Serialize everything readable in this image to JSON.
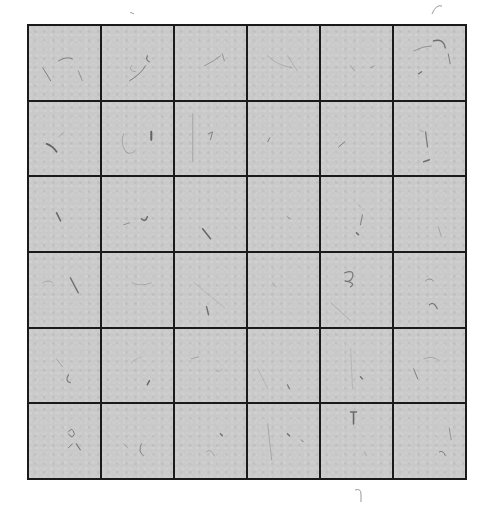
{
  "image": {
    "description": "Scanned 6x6 grid of gray squares with scattered fibers/specks",
    "background_color": "#ffffff",
    "cell_color": "#c9c9c9",
    "line_color": "#1a1a1a",
    "rows": 6,
    "columns": 6
  },
  "specks": [
    [
      {
        "d": "M14 42 L22 55",
        "w": 1
      },
      {
        "d": "M30 35 Q38 30 44 33",
        "w": 1
      },
      {
        "d": "M50 45 L54 55",
        "w": 0.8
      }
    ],
    [
      {
        "d": "M28 55 Q40 48 44 40",
        "w": 1
      },
      {
        "d": "M46 30 Q44 34 48 36",
        "w": 1.2
      },
      {
        "d": "M30 40 Q26 45 34 46",
        "w": 0.6
      }
    ],
    [
      {
        "d": "M30 40 Q40 35 46 30",
        "w": 0.8
      },
      {
        "d": "M48 28 L50 35",
        "w": 0.8
      }
    ],
    [
      {
        "d": "M20 30 Q30 40 45 42",
        "w": 0.5
      },
      {
        "d": "M40 30 L50 45",
        "w": 0.5
      }
    ],
    [
      {
        "d": "M30 40 L34 45",
        "w": 0.7
      },
      {
        "d": "M50 42 L54 40",
        "w": 0.7
      }
    ],
    [
      {
        "d": "M40 15 Q50 12 52 22",
        "w": 1.4
      },
      {
        "d": "M20 25 Q30 20 38 20",
        "w": 0.8
      },
      {
        "d": "M55 28 L57 38",
        "w": 1
      },
      {
        "d": "M25 48 L28 46",
        "w": 1.4
      }
    ],
    [
      {
        "d": "M18 42 Q24 44 28 50",
        "w": 1.8
      },
      {
        "d": "M30 35 L36 30",
        "w": 0.5
      }
    ],
    [
      {
        "d": "M22 32 Q18 40 24 50 Q30 54 34 48",
        "w": 0.6
      },
      {
        "d": "M50 30 L50 38",
        "w": 2
      }
    ],
    [
      {
        "d": "M18 12 L18 60",
        "w": 0.6
      },
      {
        "d": "M34 32 L38 30 L36 38",
        "w": 1
      }
    ],
    [
      {
        "d": "M20 40 L22 36",
        "w": 1
      }
    ],
    [
      {
        "d": "M18 45 L24 40",
        "w": 1
      }
    ],
    [
      {
        "d": "M32 30 L34 45",
        "w": 1.2
      },
      {
        "d": "M30 60 L36 58",
        "w": 1.4
      },
      {
        "d": "M26 28 L30 30",
        "w": 0.6
      }
    ],
    [
      {
        "d": "M28 36 L32 44",
        "w": 1.6
      }
    ],
    [
      {
        "d": "M22 48 L28 46",
        "w": 0.8
      },
      {
        "d": "M40 42 Q44 46 46 40",
        "w": 1.6
      }
    ],
    [
      {
        "d": "M28 52 L36 62",
        "w": 1.6
      }
    ],
    [
      {
        "d": "M40 40 L42 42",
        "w": 1
      }
    ],
    [
      {
        "d": "M38 28 L40 30",
        "w": 0.6
      },
      {
        "d": "M42 38 L40 48",
        "w": 1
      },
      {
        "d": "M36 56 L38 58",
        "w": 1.6
      }
    ],
    [
      {
        "d": "M45 50 L48 60",
        "w": 0.6
      }
    ],
    [
      {
        "d": "M14 30 Q20 26 24 30",
        "w": 0.6
      },
      {
        "d": "M42 25 L50 40",
        "w": 1.4
      }
    ],
    [
      {
        "d": "M30 30 Q40 34 50 30",
        "w": 0.5
      }
    ],
    [
      {
        "d": "M20 30 L50 55",
        "w": 0.4
      },
      {
        "d": "M32 54 L34 62",
        "w": 1.4
      }
    ],
    [
      {
        "d": "M25 30 L28 34",
        "w": 0.6
      }
    ],
    [
      {
        "d": "M24 20 Q34 16 32 24 Q30 30 24 28 Q36 30 30 34",
        "w": 1.2
      },
      {
        "d": "M10 50 L30 68",
        "w": 0.5
      }
    ],
    [
      {
        "d": "M32 28 Q36 24 40 28",
        "w": 0.8
      },
      {
        "d": "M36 52 Q40 48 44 56",
        "w": 1.2
      }
    ],
    [
      {
        "d": "M28 30 L34 38",
        "w": 0.6
      },
      {
        "d": "M40 46 Q36 52 42 54",
        "w": 1.2
      }
    ],
    [
      {
        "d": "M40 28 Q30 32 30 34",
        "w": 0.4
      },
      {
        "d": "M46 56 L48 52",
        "w": 1.6
      }
    ],
    [
      {
        "d": "M16 30 L24 28",
        "w": 0.6
      },
      {
        "d": "M40 40 Q44 46 48 40",
        "w": 0.4
      }
    ],
    [
      {
        "d": "M40 56 L42 60",
        "w": 1.2
      },
      {
        "d": "M10 40 L20 60",
        "w": 0.4
      }
    ],
    [
      {
        "d": "M30 20 L32 60",
        "w": 0.4
      },
      {
        "d": "M40 48 L42 50",
        "w": 1.4
      }
    ],
    [
      {
        "d": "M30 30 Q40 26 46 32",
        "w": 0.6
      },
      {
        "d": "M20 40 L24 50",
        "w": 1
      }
    ],
    [
      {
        "d": "M40 28 Q44 22 46 30 Q44 36 40 30",
        "w": 1
      },
      {
        "d": "M48 40 L52 46",
        "w": 1.2
      },
      {
        "d": "M40 44 L44 40",
        "w": 1
      }
    ],
    [
      {
        "d": "M40 40 Q36 48 42 52",
        "w": 1
      },
      {
        "d": "M22 40 L26 44",
        "w": 0.6
      }
    ],
    [
      {
        "d": "M32 48 Q36 44 40 52",
        "w": 0.6
      },
      {
        "d": "M46 30 L48 32",
        "w": 1.4
      }
    ],
    [
      {
        "d": "M20 20 L24 56",
        "w": 0.6
      },
      {
        "d": "M40 30 L42 32",
        "w": 1.4
      },
      {
        "d": "M54 36 L56 38",
        "w": 1
      }
    ],
    [
      {
        "d": "M30 8 L36 8 M33 8 L33 20",
        "w": 1.6
      },
      {
        "d": "M44 48 L46 52",
        "w": 0.6
      }
    ],
    [
      {
        "d": "M56 24 L58 36",
        "w": 0.8
      },
      {
        "d": "M46 48 Q50 46 52 52",
        "w": 1
      }
    ]
  ],
  "stray_marks": [
    {
      "label": "top-right-pencil-mark",
      "x": 430,
      "y": 2,
      "d": "M2 12 Q6 2 12 4",
      "w": 1
    },
    {
      "label": "bottom-center-mark",
      "x": 355,
      "y": 488,
      "d": "M0 2 Q6 0 6 6 L6 14",
      "w": 1
    },
    {
      "label": "top-left-speck",
      "x": 130,
      "y": 12,
      "d": "M0 0 L4 2",
      "w": 1
    }
  ]
}
